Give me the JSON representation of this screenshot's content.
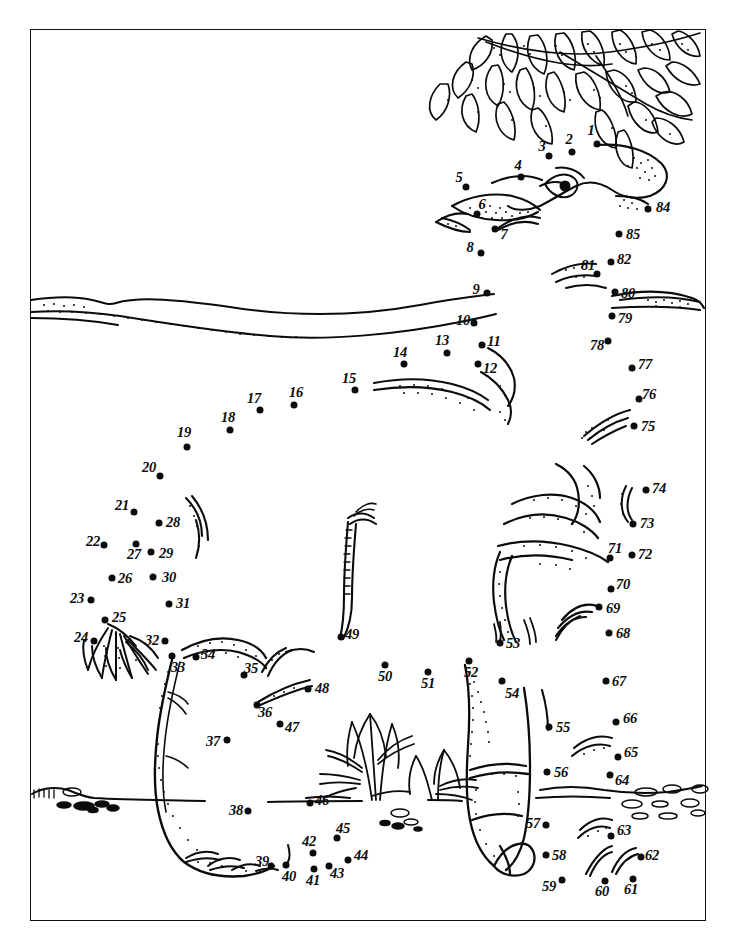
{
  "page": {
    "kind": "connect-the-dots-puzzle",
    "background_color": "#ffffff",
    "ink_color": "#0b0b0b",
    "border": {
      "x": 30,
      "y": 29,
      "width": 676,
      "height": 892
    }
  },
  "scene": {
    "foliage_label": "leafy-branch-top-right",
    "horizon_label": "distant-hill-horizon-line",
    "ground_label": "foreground-ground-line",
    "grass_label": "grass-tuft-clump",
    "pebbles_label": "scattered-pebbles",
    "tail_tuft_label": "tail-hair-tuft",
    "eye_label": "elephant-eye",
    "trunk_label": "trunk-outline",
    "foot_label": "front-foot-detail"
  },
  "dots": [
    {
      "n": "1",
      "x": 597,
      "y": 144,
      "lx": 591,
      "ly": 130
    },
    {
      "n": "2",
      "x": 572,
      "y": 152,
      "lx": 569,
      "ly": 139
    },
    {
      "n": "3",
      "x": 549,
      "y": 156,
      "lx": 542,
      "ly": 146
    },
    {
      "n": "4",
      "x": 521,
      "y": 177,
      "lx": 518,
      "ly": 165
    },
    {
      "n": "5",
      "x": 466,
      "y": 187,
      "lx": 459,
      "ly": 177
    },
    {
      "n": "6",
      "x": 477,
      "y": 214,
      "lx": 482,
      "ly": 204
    },
    {
      "n": "7",
      "x": 495,
      "y": 229,
      "lx": 504,
      "ly": 234
    },
    {
      "n": "8",
      "x": 481,
      "y": 253,
      "lx": 470,
      "ly": 247
    },
    {
      "n": "9",
      "x": 487,
      "y": 293,
      "lx": 476,
      "ly": 289
    },
    {
      "n": "10",
      "x": 474,
      "y": 323,
      "lx": 463,
      "ly": 320
    },
    {
      "n": "11",
      "x": 482,
      "y": 345,
      "lx": 494,
      "ly": 341
    },
    {
      "n": "12",
      "x": 478,
      "y": 364,
      "lx": 490,
      "ly": 368
    },
    {
      "n": "13",
      "x": 447,
      "y": 353,
      "lx": 442,
      "ly": 340
    },
    {
      "n": "14",
      "x": 404,
      "y": 364,
      "lx": 400,
      "ly": 352
    },
    {
      "n": "15",
      "x": 355,
      "y": 390,
      "lx": 349,
      "ly": 378
    },
    {
      "n": "16",
      "x": 294,
      "y": 405,
      "lx": 296,
      "ly": 392
    },
    {
      "n": "17",
      "x": 260,
      "y": 410,
      "lx": 254,
      "ly": 398
    },
    {
      "n": "18",
      "x": 230,
      "y": 430,
      "lx": 228,
      "ly": 417
    },
    {
      "n": "19",
      "x": 187,
      "y": 447,
      "lx": 184,
      "ly": 432
    },
    {
      "n": "20",
      "x": 160,
      "y": 476,
      "lx": 149,
      "ly": 467
    },
    {
      "n": "21",
      "x": 134,
      "y": 512,
      "lx": 122,
      "ly": 505
    },
    {
      "n": "22",
      "x": 104,
      "y": 545,
      "lx": 93,
      "ly": 541
    },
    {
      "n": "23",
      "x": 91,
      "y": 600,
      "lx": 77,
      "ly": 598
    },
    {
      "n": "24",
      "x": 94,
      "y": 641,
      "lx": 81,
      "ly": 637
    },
    {
      "n": "25",
      "x": 105,
      "y": 620,
      "lx": 119,
      "ly": 617
    },
    {
      "n": "26",
      "x": 112,
      "y": 578,
      "lx": 125,
      "ly": 578
    },
    {
      "n": "27",
      "x": 136,
      "y": 544,
      "lx": 134,
      "ly": 554
    },
    {
      "n": "28",
      "x": 159,
      "y": 523,
      "lx": 173,
      "ly": 522
    },
    {
      "n": "29",
      "x": 151,
      "y": 552,
      "lx": 166,
      "ly": 553
    },
    {
      "n": "30",
      "x": 153,
      "y": 577,
      "lx": 169,
      "ly": 577
    },
    {
      "n": "31",
      "x": 169,
      "y": 604,
      "lx": 183,
      "ly": 603
    },
    {
      "n": "32",
      "x": 165,
      "y": 641,
      "lx": 152,
      "ly": 640
    },
    {
      "n": "33",
      "x": 172,
      "y": 656,
      "lx": 178,
      "ly": 667
    },
    {
      "n": "34",
      "x": 196,
      "y": 657,
      "lx": 208,
      "ly": 654
    },
    {
      "n": "35",
      "x": 244,
      "y": 675,
      "lx": 251,
      "ly": 668
    },
    {
      "n": "36",
      "x": 257,
      "y": 705,
      "lx": 265,
      "ly": 712
    },
    {
      "n": "37",
      "x": 227,
      "y": 740,
      "lx": 213,
      "ly": 741
    },
    {
      "n": "38",
      "x": 248,
      "y": 811,
      "lx": 236,
      "ly": 810
    },
    {
      "n": "39",
      "x": 271,
      "y": 866,
      "lx": 262,
      "ly": 861
    },
    {
      "n": "40",
      "x": 286,
      "y": 865,
      "lx": 289,
      "ly": 876
    },
    {
      "n": "41",
      "x": 314,
      "y": 869,
      "lx": 313,
      "ly": 880
    },
    {
      "n": "42",
      "x": 313,
      "y": 853,
      "lx": 309,
      "ly": 841
    },
    {
      "n": "43",
      "x": 329,
      "y": 866,
      "lx": 337,
      "ly": 873
    },
    {
      "n": "44",
      "x": 348,
      "y": 860,
      "lx": 361,
      "ly": 855
    },
    {
      "n": "45",
      "x": 337,
      "y": 838,
      "lx": 343,
      "ly": 828
    },
    {
      "n": "46",
      "x": 310,
      "y": 803,
      "lx": 322,
      "ly": 800
    },
    {
      "n": "47",
      "x": 280,
      "y": 724,
      "lx": 292,
      "ly": 727
    },
    {
      "n": "48",
      "x": 308,
      "y": 689,
      "lx": 322,
      "ly": 688
    },
    {
      "n": "49",
      "x": 341,
      "y": 637,
      "lx": 352,
      "ly": 634
    },
    {
      "n": "50",
      "x": 385,
      "y": 665,
      "lx": 385,
      "ly": 676
    },
    {
      "n": "51",
      "x": 428,
      "y": 672,
      "lx": 428,
      "ly": 683
    },
    {
      "n": "52",
      "x": 469,
      "y": 661,
      "lx": 471,
      "ly": 672
    },
    {
      "n": "53",
      "x": 500,
      "y": 643,
      "lx": 513,
      "ly": 643
    },
    {
      "n": "54",
      "x": 502,
      "y": 681,
      "lx": 512,
      "ly": 693
    },
    {
      "n": "55",
      "x": 549,
      "y": 727,
      "lx": 563,
      "ly": 727
    },
    {
      "n": "56",
      "x": 547,
      "y": 772,
      "lx": 561,
      "ly": 772
    },
    {
      "n": "57",
      "x": 546,
      "y": 825,
      "lx": 533,
      "ly": 823
    },
    {
      "n": "58",
      "x": 546,
      "y": 855,
      "lx": 559,
      "ly": 855
    },
    {
      "n": "59",
      "x": 562,
      "y": 880,
      "lx": 549,
      "ly": 886
    },
    {
      "n": "60",
      "x": 605,
      "y": 881,
      "lx": 602,
      "ly": 891
    },
    {
      "n": "61",
      "x": 633,
      "y": 879,
      "lx": 631,
      "ly": 889
    },
    {
      "n": "62",
      "x": 641,
      "y": 857,
      "lx": 652,
      "ly": 855
    },
    {
      "n": "63",
      "x": 611,
      "y": 836,
      "lx": 624,
      "ly": 830
    },
    {
      "n": "64",
      "x": 610,
      "y": 775,
      "lx": 622,
      "ly": 780
    },
    {
      "n": "65",
      "x": 618,
      "y": 757,
      "lx": 631,
      "ly": 752
    },
    {
      "n": "66",
      "x": 616,
      "y": 722,
      "lx": 630,
      "ly": 718
    },
    {
      "n": "67",
      "x": 606,
      "y": 681,
      "lx": 619,
      "ly": 681
    },
    {
      "n": "68",
      "x": 609,
      "y": 633,
      "lx": 623,
      "ly": 633
    },
    {
      "n": "69",
      "x": 599,
      "y": 607,
      "lx": 613,
      "ly": 608
    },
    {
      "n": "70",
      "x": 611,
      "y": 589,
      "lx": 623,
      "ly": 584
    },
    {
      "n": "71",
      "x": 610,
      "y": 558,
      "lx": 615,
      "ly": 548
    },
    {
      "n": "72",
      "x": 632,
      "y": 555,
      "lx": 645,
      "ly": 554
    },
    {
      "n": "73",
      "x": 633,
      "y": 524,
      "lx": 647,
      "ly": 523
    },
    {
      "n": "74",
      "x": 646,
      "y": 490,
      "lx": 659,
      "ly": 488
    },
    {
      "n": "75",
      "x": 634,
      "y": 426,
      "lx": 648,
      "ly": 426
    },
    {
      "n": "76",
      "x": 639,
      "y": 399,
      "lx": 649,
      "ly": 394
    },
    {
      "n": "77",
      "x": 632,
      "y": 368,
      "lx": 645,
      "ly": 364
    },
    {
      "n": "78",
      "x": 608,
      "y": 341,
      "lx": 597,
      "ly": 345
    },
    {
      "n": "79",
      "x": 612,
      "y": 316,
      "lx": 625,
      "ly": 318
    },
    {
      "n": "80",
      "x": 615,
      "y": 292,
      "lx": 628,
      "ly": 293
    },
    {
      "n": "81",
      "x": 597,
      "y": 274,
      "lx": 588,
      "ly": 265
    },
    {
      "n": "82",
      "x": 611,
      "y": 262,
      "lx": 624,
      "ly": 259
    },
    {
      "n": "84",
      "x": 648,
      "y": 209,
      "lx": 663,
      "ly": 207
    },
    {
      "n": "85",
      "x": 619,
      "y": 234,
      "lx": 633,
      "ly": 234
    }
  ]
}
